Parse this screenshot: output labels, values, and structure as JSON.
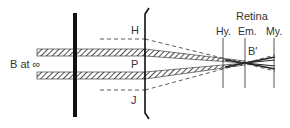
{
  "diagram": {
    "object_label": "B at ∞",
    "pinhole_labels": {
      "top": "H",
      "middle": "P",
      "bottom": "J"
    },
    "retina_title": "Retina",
    "retina_planes": [
      "Hy.",
      "Em.",
      "My."
    ],
    "image_label": "B′",
    "colors": {
      "ink": "#222222",
      "text": "#333333",
      "background": "#ffffff"
    }
  }
}
